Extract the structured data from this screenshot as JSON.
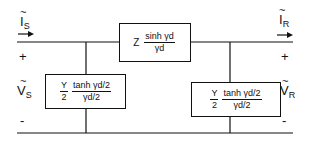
{
  "diagram": {
    "colors": {
      "line": "#111111",
      "background": "#ffffff"
    },
    "sending": {
      "current_label": "I",
      "current_sub": "S",
      "voltage_label": "V",
      "voltage_sub": "S",
      "plus": "+",
      "minus": "-"
    },
    "receiving": {
      "current_label": "I",
      "current_sub": "R",
      "voltage_label": "V",
      "voltage_sub": "R",
      "plus": "+",
      "minus": "-"
    },
    "tilde": "~",
    "series": {
      "prefix": "Z",
      "numerator": "sinh  γd",
      "denominator": "γd"
    },
    "shunt_left": {
      "coef_num": "Y",
      "coef_den": "2",
      "numerator": "tanh  γd/2",
      "denominator": "γd/2"
    },
    "shunt_right": {
      "coef_num": "Y",
      "coef_den": "2",
      "numerator": "tanh  γd/2",
      "denominator": "γd/2"
    }
  }
}
